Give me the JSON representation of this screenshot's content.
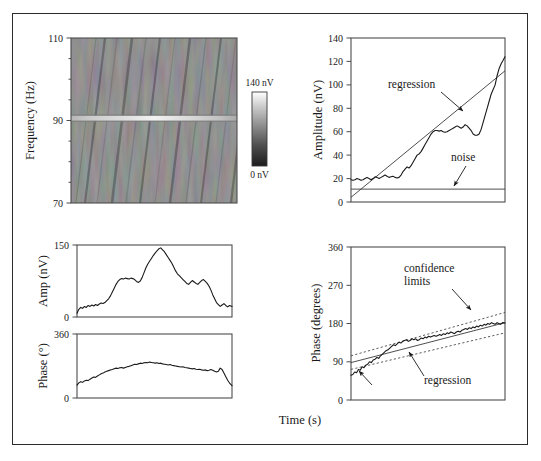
{
  "figure": {
    "name": "spectrogram-and-amplitude-phase-analysis-figure",
    "x_axis_label": "Time (s)",
    "frame_color": "#2b2b2b",
    "background_color": "#ffffff",
    "curve_color": "#1a1a1a"
  },
  "colorbar": {
    "name": "amplitude-colorbar",
    "top_label": "140 nV",
    "bottom_label": "0 nV",
    "top_color": "#ffffff",
    "bottom_color": "#1c1c1c"
  },
  "chart_data": [
    {
      "id": "spectrogram",
      "type": "heatmap",
      "title": "",
      "xlabel": "",
      "ylabel": "Frequency (Hz)",
      "ylim": [
        70,
        110
      ],
      "yticks": [
        70,
        90,
        110
      ],
      "ytick_labels": [
        "70",
        "90",
        "110"
      ],
      "yminor_ticks": [
        75,
        80,
        85,
        95,
        100,
        105
      ],
      "grid": false,
      "colormap": "gray",
      "cmin_nv": 0,
      "cmax_nv": 140,
      "background_level_nv": 28,
      "feature": {
        "description": "bright horizontal band",
        "frequency_hz": 91.5,
        "amplitude_nv": 140,
        "band_half_width_hz": 0.7
      },
      "texture": {
        "description": "diagonal striations of low-amplitude noise",
        "stripe_angle_deg": 78,
        "noise_rms_nv": 9
      }
    },
    {
      "id": "amplitude-vs-time",
      "type": "line",
      "title": "",
      "xlabel": "",
      "ylabel": "Amplitude (nV)",
      "ylim": [
        0,
        140
      ],
      "yticks": [
        0,
        20,
        40,
        60,
        80,
        100,
        120,
        140
      ],
      "ytick_labels": [
        "0",
        "20",
        "40",
        "60",
        "80",
        "100",
        "120",
        "140"
      ],
      "xlim": [
        0,
        1
      ],
      "grid": false,
      "annotations": [
        {
          "text": "regression",
          "x": 0.3,
          "y": 98
        },
        {
          "text": "noise",
          "x": 0.8,
          "y": 32
        }
      ],
      "series": [
        {
          "name": "measured amplitude",
          "style": "solid",
          "x": [
            0.0,
            0.013,
            0.026,
            0.039,
            0.052,
            0.065,
            0.078,
            0.091,
            0.104,
            0.117,
            0.13,
            0.143,
            0.156,
            0.169,
            0.182,
            0.195,
            0.208,
            0.221,
            0.234,
            0.247,
            0.26,
            0.273,
            0.286,
            0.299,
            0.312,
            0.325,
            0.338,
            0.351,
            0.364,
            0.377,
            0.39,
            0.403,
            0.416,
            0.429,
            0.442,
            0.455,
            0.468,
            0.481,
            0.494,
            0.507,
            0.52,
            0.533,
            0.546,
            0.559,
            0.572,
            0.585,
            0.598,
            0.611,
            0.624,
            0.637,
            0.65,
            0.663,
            0.676,
            0.689,
            0.702,
            0.715,
            0.728,
            0.741,
            0.754,
            0.767,
            0.78,
            0.793,
            0.806,
            0.819,
            0.832,
            0.845,
            0.858,
            0.871,
            0.884,
            0.897,
            0.91,
            0.923,
            0.936,
            0.949,
            0.962,
            0.975,
            0.988,
            1.0
          ],
          "values": [
            19,
            18.5,
            19,
            20,
            19.5,
            18.5,
            19,
            20,
            21,
            20,
            19,
            20,
            21.5,
            21,
            20,
            21,
            22,
            23,
            22,
            21,
            21.5,
            22,
            21,
            20.5,
            21,
            23,
            26,
            28,
            30,
            29,
            31,
            34,
            37,
            40,
            41,
            43,
            46,
            49,
            52,
            55,
            58,
            60,
            61,
            61,
            60.5,
            61,
            60,
            59.5,
            60,
            61,
            62,
            63,
            64,
            65,
            64,
            63,
            64,
            66,
            65,
            63,
            61,
            58,
            57,
            57,
            58,
            62,
            68,
            74,
            80,
            86,
            92,
            96,
            100,
            108,
            114,
            118,
            121,
            124,
            129,
            135,
            137
          ]
        },
        {
          "name": "regression",
          "style": "solid-thin",
          "x": [
            0,
            1
          ],
          "values": [
            4,
            112
          ]
        },
        {
          "name": "noise",
          "style": "solid-thin",
          "x": [
            0,
            1
          ],
          "values": [
            11,
            11
          ]
        }
      ]
    },
    {
      "id": "amp-slice",
      "type": "line",
      "title": "",
      "xlabel": "",
      "ylabel": "Amp (nV)",
      "ylim": [
        0,
        150
      ],
      "yticks": [
        0,
        150
      ],
      "ytick_labels": [
        "0",
        "150"
      ],
      "grid": false,
      "series": [
        {
          "name": "amplitude slice",
          "style": "solid",
          "x": [
            0.0,
            0.012,
            0.024,
            0.036,
            0.048,
            0.06,
            0.072,
            0.084,
            0.096,
            0.108,
            0.12,
            0.132,
            0.144,
            0.156,
            0.168,
            0.18,
            0.192,
            0.204,
            0.216,
            0.228,
            0.24,
            0.252,
            0.264,
            0.276,
            0.288,
            0.3,
            0.312,
            0.324,
            0.336,
            0.348,
            0.36,
            0.372,
            0.384,
            0.396,
            0.408,
            0.42,
            0.432,
            0.444,
            0.456,
            0.468,
            0.48,
            0.492,
            0.504,
            0.516,
            0.528,
            0.54,
            0.552,
            0.564,
            0.576,
            0.588,
            0.6,
            0.612,
            0.624,
            0.636,
            0.648,
            0.66,
            0.672,
            0.684,
            0.696,
            0.708,
            0.72,
            0.732,
            0.744,
            0.756,
            0.768,
            0.78,
            0.792,
            0.804,
            0.816,
            0.828,
            0.84,
            0.852,
            0.864,
            0.876,
            0.888,
            0.9,
            0.912,
            0.924,
            0.936,
            0.948,
            0.96,
            0.972,
            0.984,
            1.0
          ],
          "values": [
            8,
            16,
            20,
            18,
            22,
            20,
            24,
            22,
            25,
            23,
            26,
            24,
            27,
            29,
            28,
            30,
            34,
            38,
            44,
            52,
            60,
            68,
            74,
            78,
            80,
            79,
            81,
            80,
            79,
            81,
            80,
            78,
            74,
            72,
            75,
            82,
            92,
            102,
            110,
            116,
            122,
            128,
            133,
            138,
            142,
            144,
            140,
            136,
            130,
            124,
            118,
            112,
            104,
            96,
            90,
            86,
            82,
            78,
            74,
            70,
            68,
            72,
            76,
            73,
            70,
            68,
            72,
            76,
            78,
            74,
            70,
            64,
            56,
            46,
            38,
            30,
            26,
            22,
            25,
            28,
            24,
            21,
            24,
            22
          ]
        }
      ]
    },
    {
      "id": "phase-slice",
      "type": "line",
      "title": "",
      "xlabel": "",
      "ylabel": "Phase (°)",
      "ylim": [
        0,
        360
      ],
      "yticks": [
        0,
        360
      ],
      "ytick_labels": [
        "0",
        "360"
      ],
      "grid": false,
      "series": [
        {
          "name": "phase slice",
          "style": "solid",
          "x": [
            0.0,
            0.012,
            0.024,
            0.036,
            0.048,
            0.06,
            0.072,
            0.084,
            0.096,
            0.108,
            0.12,
            0.132,
            0.144,
            0.156,
            0.168,
            0.18,
            0.192,
            0.204,
            0.216,
            0.228,
            0.24,
            0.252,
            0.264,
            0.276,
            0.288,
            0.3,
            0.312,
            0.324,
            0.336,
            0.348,
            0.36,
            0.372,
            0.384,
            0.396,
            0.408,
            0.42,
            0.432,
            0.444,
            0.456,
            0.468,
            0.48,
            0.492,
            0.504,
            0.516,
            0.528,
            0.54,
            0.552,
            0.564,
            0.576,
            0.588,
            0.6,
            0.612,
            0.624,
            0.636,
            0.648,
            0.66,
            0.672,
            0.684,
            0.696,
            0.708,
            0.72,
            0.732,
            0.744,
            0.756,
            0.768,
            0.78,
            0.792,
            0.804,
            0.816,
            0.828,
            0.84,
            0.852,
            0.864,
            0.876,
            0.888,
            0.9,
            0.912,
            0.924,
            0.936,
            0.948,
            0.96,
            0.972,
            0.984,
            1.0
          ],
          "values": [
            72,
            85,
            92,
            88,
            96,
            100,
            98,
            106,
            112,
            118,
            116,
            124,
            130,
            136,
            140,
            146,
            150,
            154,
            158,
            160,
            164,
            168,
            166,
            170,
            172,
            168,
            172,
            176,
            178,
            182,
            186,
            190,
            188,
            192,
            196,
            194,
            198,
            200,
            198,
            202,
            200,
            198,
            196,
            198,
            194,
            196,
            192,
            190,
            188,
            186,
            188,
            184,
            182,
            180,
            178,
            176,
            174,
            176,
            172,
            170,
            168,
            166,
            164,
            166,
            162,
            160,
            162,
            158,
            156,
            158,
            154,
            156,
            160,
            156,
            150,
            146,
            150,
            168,
            160,
            140,
            120,
            100,
            84,
            70
          ]
        }
      ]
    },
    {
      "id": "phase-vs-time",
      "type": "line",
      "title": "",
      "xlabel": "",
      "ylabel": "Phase (degrees)",
      "ylim": [
        0,
        360
      ],
      "yticks": [
        0,
        90,
        180,
        270,
        360
      ],
      "ytick_labels": [
        "0",
        "90",
        "180",
        "270",
        "360"
      ],
      "xlim": [
        0,
        1
      ],
      "grid": false,
      "annotations": [
        {
          "text": "confidence limits",
          "x": 0.38,
          "y": 262
        },
        {
          "text": "regression",
          "x": 0.55,
          "y": 66
        }
      ],
      "series": [
        {
          "name": "measured phase",
          "style": "solid",
          "x": [
            0.0,
            0.012,
            0.024,
            0.036,
            0.048,
            0.06,
            0.072,
            0.084,
            0.096,
            0.108,
            0.12,
            0.132,
            0.144,
            0.156,
            0.168,
            0.18,
            0.192,
            0.204,
            0.216,
            0.228,
            0.24,
            0.252,
            0.264,
            0.276,
            0.288,
            0.3,
            0.312,
            0.324,
            0.336,
            0.348,
            0.36,
            0.372,
            0.384,
            0.396,
            0.408,
            0.42,
            0.432,
            0.444,
            0.456,
            0.468,
            0.48,
            0.492,
            0.504,
            0.516,
            0.528,
            0.54,
            0.552,
            0.564,
            0.576,
            0.588,
            0.6,
            0.612,
            0.624,
            0.636,
            0.648,
            0.66,
            0.672,
            0.684,
            0.696,
            0.708,
            0.72,
            0.732,
            0.744,
            0.756,
            0.768,
            0.78,
            0.792,
            0.804,
            0.816,
            0.828,
            0.84,
            0.852,
            0.864,
            0.876,
            0.888,
            0.9,
            0.912,
            0.924,
            0.936,
            0.948,
            0.96,
            0.972,
            0.984,
            1.0
          ],
          "values": [
            58,
            60,
            66,
            64,
            72,
            70,
            78,
            76,
            82,
            84,
            90,
            88,
            94,
            96,
            100,
            98,
            104,
            108,
            112,
            116,
            118,
            122,
            126,
            130,
            128,
            132,
            136,
            134,
            138,
            140,
            142,
            138,
            140,
            144,
            142,
            144,
            140,
            142,
            146,
            144,
            148,
            146,
            150,
            148,
            150,
            152,
            150,
            152,
            154,
            152,
            156,
            154,
            158,
            156,
            160,
            158,
            156,
            160,
            162,
            160,
            164,
            166,
            168,
            166,
            170,
            168,
            172,
            170,
            174,
            172,
            176,
            174,
            178,
            176,
            180,
            178,
            182,
            180,
            178,
            182,
            180,
            178,
            182,
            181
          ]
        },
        {
          "name": "regression",
          "style": "solid-thin",
          "x": [
            0,
            1
          ],
          "values": [
            88,
            182
          ]
        },
        {
          "name": "upper confidence limit",
          "style": "dashed",
          "x": [
            0,
            1
          ],
          "values": [
            104,
            206
          ]
        },
        {
          "name": "lower confidence limit",
          "style": "dashed",
          "x": [
            0,
            1
          ],
          "values": [
            72,
            158
          ]
        }
      ]
    }
  ]
}
